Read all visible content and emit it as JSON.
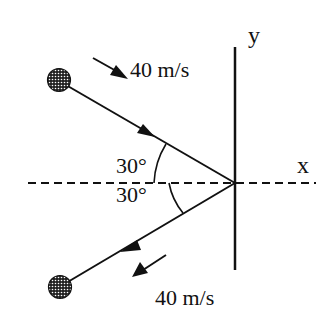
{
  "diagram": {
    "axes": {
      "x_label": "x",
      "y_label": "y"
    },
    "incoming": {
      "speed_label": "40 m/s",
      "angle_label": "30°"
    },
    "outgoing": {
      "speed_label": "40 m/s",
      "angle_label": "30°"
    },
    "colors": {
      "ink": "#111111",
      "background": "#ffffff"
    }
  }
}
